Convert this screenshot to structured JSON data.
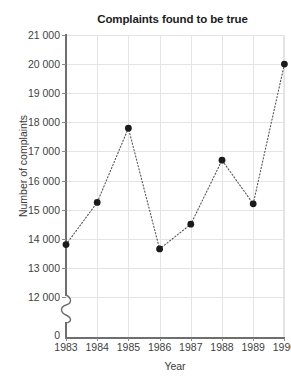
{
  "chart_data": {
    "type": "line",
    "title": "Complaints found to be true",
    "xlabel": "Year",
    "ylabel": "Number of complaints",
    "categories": [
      "1983",
      "1984",
      "1985",
      "1986",
      "1987",
      "1988",
      "1989",
      "1990"
    ],
    "x": [
      1983,
      1984,
      1985,
      1986,
      1987,
      1988,
      1989,
      1990
    ],
    "values": [
      13800,
      15250,
      17800,
      13650,
      14500,
      16700,
      15200,
      20000
    ],
    "series": [
      {
        "name": "Complaints found to be true",
        "values": [
          13800,
          15250,
          17800,
          13650,
          14500,
          16700,
          15200,
          20000
        ]
      }
    ],
    "ylim": [
      12000,
      21000
    ],
    "y_axis_broken": true,
    "y_zero_label": "0",
    "y_ticks": [
      12000,
      13000,
      14000,
      15000,
      16000,
      17000,
      18000,
      19000,
      20000,
      21000
    ],
    "y_tick_labels": [
      "12 000",
      "13 000",
      "14 000",
      "15 000",
      "16 000",
      "17 000",
      "18 000",
      "19 000",
      "20 000",
      "21 000"
    ],
    "grid": true,
    "legend": false,
    "line_style": "dotted",
    "marker": "circle",
    "colors": {
      "marker": "#1b1b1b",
      "line": "#555555",
      "grid": "#e4e4e4",
      "axis": "#6e6e6e",
      "text": "#3a3a3a",
      "title": "#1c1c1c",
      "background": "#ffffff"
    }
  }
}
